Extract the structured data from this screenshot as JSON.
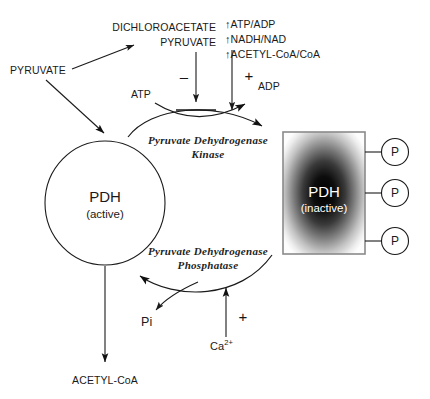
{
  "diagram": {
    "colors": {
      "line": "#1a1a1a",
      "text": "#1a1a1a",
      "box_border": "#808080",
      "box_center": "#000000",
      "box_edge": "#ffffff",
      "background": "#ffffff"
    }
  },
  "nodes": {
    "pyruvate_left": "PYRUVATE",
    "dichloroacetate": "DICHLOROACETATE",
    "pyruvate_top": "PYRUVATE",
    "atp": "ATP",
    "adp": "ADP",
    "pi": "Pi",
    "calcium": "Ca",
    "calcium_charge": "2+",
    "acetyl_coa": "ACETYL-CoA"
  },
  "activators": {
    "items": [
      {
        "arrow": "↑",
        "label": "ATP/ADP"
      },
      {
        "arrow": "↑",
        "label": "NADH/NAD"
      },
      {
        "arrow": "↑",
        "label": "ACETYL-CoA/CoA"
      }
    ]
  },
  "signs": {
    "inhibition": "–",
    "activation_kinase": "+",
    "activation_phosphatase": "+"
  },
  "enzymes": {
    "kinase_line1": "Pyruvate Dehydrogenase",
    "kinase_line2": "Kinase",
    "phosphatase_line1": "Pyruvate Dehydrogenase",
    "phosphatase_line2": "Phosphatase"
  },
  "states": {
    "active": {
      "name": "PDH",
      "state": "(active)"
    },
    "inactive": {
      "name": "PDH",
      "state": "(inactive)"
    }
  },
  "phosphates": [
    {
      "label": "P"
    },
    {
      "label": "P"
    },
    {
      "label": "P"
    }
  ]
}
